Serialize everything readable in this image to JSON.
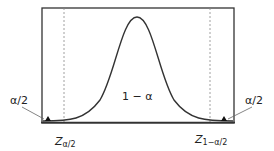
{
  "diagram": {
    "center_label": "1 − α",
    "left_tail_label": "α/2",
    "right_tail_label": "α/2",
    "left_critical": {
      "base": "Z",
      "sub": "α/2"
    },
    "right_critical": {
      "base": "Z",
      "sub": "1−α/2"
    },
    "colors": {
      "line": "#333333",
      "dashed": "#888888"
    }
  }
}
